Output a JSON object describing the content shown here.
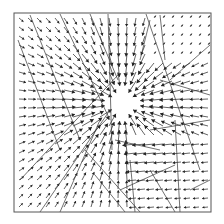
{
  "chart_data": {
    "type": "quiver",
    "title": "",
    "xlabel": "",
    "ylabel": "",
    "axes_visible": false,
    "grid": false,
    "legend": null,
    "frame": {
      "x": 14,
      "y": 13,
      "w": 197,
      "h": 199
    },
    "center_hole": {
      "cx": 122,
      "cy": 103,
      "r": 22
    },
    "field": {
      "description": "Vector field of arrows converging radially toward a central void near (122,103); arrow length grows near the void; left side arrows point right/inward, right side arrows point left/inward, lower-right region with small leftward arrows",
      "grid_spacing_px": 9,
      "max_arrow_len_px": 14,
      "min_arrow_len_px": 2,
      "arrow_color": "#222222"
    },
    "fault_lines": [
      [
        [
          18,
          40
        ],
        [
          60,
          150
        ]
      ],
      [
        [
          30,
          15
        ],
        [
          80,
          140
        ]
      ],
      [
        [
          60,
          14
        ],
        [
          110,
          120
        ]
      ],
      [
        [
          90,
          14
        ],
        [
          118,
          80
        ]
      ],
      [
        [
          108,
          14
        ],
        [
          112,
          150
        ]
      ],
      [
        [
          140,
          60
        ],
        [
          150,
          20
        ]
      ],
      [
        [
          146,
          14
        ],
        [
          200,
          170
        ]
      ],
      [
        [
          160,
          15
        ],
        [
          165,
          60
        ]
      ],
      [
        [
          170,
          80
        ],
        [
          210,
          45
        ]
      ],
      [
        [
          150,
          130
        ],
        [
          210,
          120
        ]
      ],
      [
        [
          20,
          180
        ],
        [
          118,
          75
        ]
      ],
      [
        [
          40,
          212
        ],
        [
          110,
          110
        ]
      ],
      [
        [
          60,
          212
        ],
        [
          100,
          120
        ]
      ],
      [
        [
          85,
          150
        ],
        [
          140,
          212
        ]
      ],
      [
        [
          95,
          175
        ],
        [
          125,
          212
        ]
      ],
      [
        [
          130,
          160
        ],
        [
          135,
          212
        ]
      ],
      [
        [
          150,
          170
        ],
        [
          175,
          212
        ]
      ],
      [
        [
          175,
          120
        ],
        [
          180,
          212
        ]
      ],
      [
        [
          190,
          190
        ],
        [
          210,
          180
        ]
      ],
      [
        [
          115,
          140
        ],
        [
          160,
          150
        ]
      ],
      [
        [
          120,
          190
        ],
        [
          175,
          165
        ]
      ],
      [
        [
          160,
          80
        ],
        [
          210,
          95
        ]
      ]
    ],
    "colors": {
      "background": "#ffffff",
      "frame": "#555555",
      "lines": "#333333"
    }
  }
}
